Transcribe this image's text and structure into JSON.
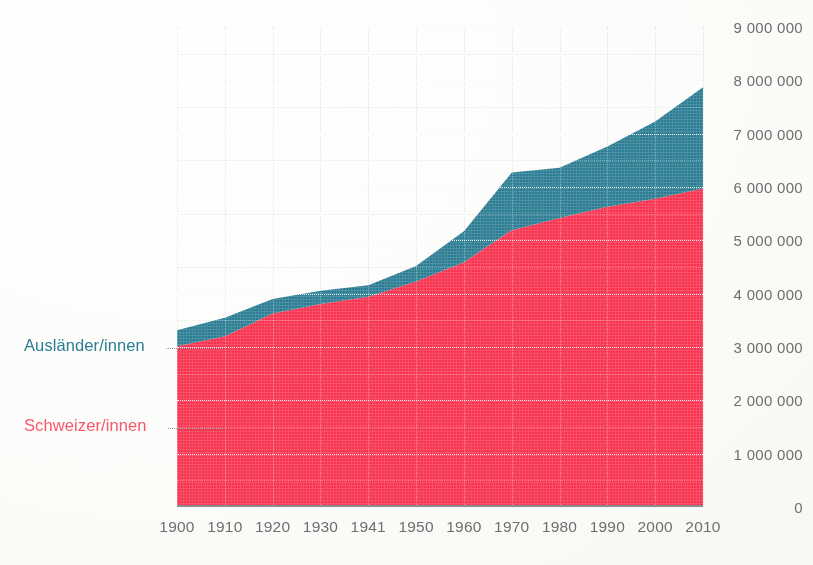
{
  "chart_data": {
    "type": "area",
    "stacked": true,
    "title": "",
    "subtitle": "",
    "xlabel": "",
    "ylabel": "",
    "grid": true,
    "legend_position": "left-inline",
    "xlim": [
      1900,
      2010
    ],
    "ylim": [
      0,
      9000000
    ],
    "categories": [
      "1900",
      "1910",
      "1920",
      "1930",
      "1941",
      "1950",
      "1960",
      "1970",
      "1980",
      "1990",
      "2000",
      "2010"
    ],
    "x_tick_labels": [
      "1900",
      "1910",
      "1920",
      "1930",
      "1941",
      "1950",
      "1960",
      "1970",
      "1980",
      "1990",
      "2000",
      "2010"
    ],
    "y_tick_labels": [
      "9 000 000",
      "8 000 000",
      "7 000 000",
      "6 000 000",
      "5 000 000",
      "4 000 000",
      "3 000 000",
      "2 000 000",
      "1 000 000",
      "0"
    ],
    "y_tick_values": [
      9000000,
      8000000,
      7000000,
      6000000,
      5000000,
      4000000,
      3000000,
      2000000,
      1000000,
      0
    ],
    "y_minor_step": 500000,
    "series": [
      {
        "name": "Schweizer/innen",
        "color": "#f8334f",
        "label_color": "#f8576c",
        "values": [
          3015000,
          3200000,
          3630000,
          3805000,
          3940000,
          4230000,
          4590000,
          5190000,
          5420000,
          5630000,
          5780000,
          5970000
        ]
      },
      {
        "name": "Ausländer/innen",
        "color": "#2c7d93",
        "label_color": "#2c7d93",
        "values": [
          300000,
          350000,
          270000,
          250000,
          220000,
          290000,
          580000,
          1080000,
          940000,
          1130000,
          1450000,
          1900000
        ]
      }
    ],
    "totals": [
      3315000,
      3550000,
      3900000,
      4055000,
      4160000,
      4520000,
      5170000,
      6270000,
      6360000,
      6760000,
      7230000,
      7870000
    ]
  },
  "legend": {
    "foreigners_label": "Ausländer/innen",
    "swiss_label": "Schweizer/innen"
  },
  "colors": {
    "swiss_red": "#f8334f",
    "foreigners_teal": "#2c7d93",
    "axis_text": "#6e6e6e",
    "grid_major": "#7e7e7e",
    "grid_minor": "#cfcfcf",
    "background": "#fdfdfb"
  }
}
